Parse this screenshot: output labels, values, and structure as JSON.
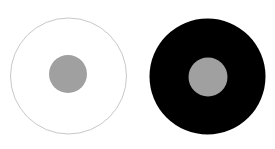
{
  "figure": {
    "background_color": "#ffffff",
    "panels": [
      {
        "name": "white-surround",
        "outer": {
          "cx": 68.5,
          "cy": 76,
          "r": 58,
          "fill": "#ffffff",
          "stroke": "#c8c8c8",
          "stroke_width": 1
        },
        "inner": {
          "cx": 68,
          "cy": 74,
          "r": 19,
          "fill": "#a0a0a0"
        }
      },
      {
        "name": "black-surround",
        "outer": {
          "cx": 207.5,
          "cy": 76.5,
          "r": 58,
          "fill": "#000000",
          "stroke": "none",
          "stroke_width": 0
        },
        "inner": {
          "cx": 208,
          "cy": 77,
          "r": 19.5,
          "fill": "#a0a0a0"
        }
      }
    ]
  }
}
